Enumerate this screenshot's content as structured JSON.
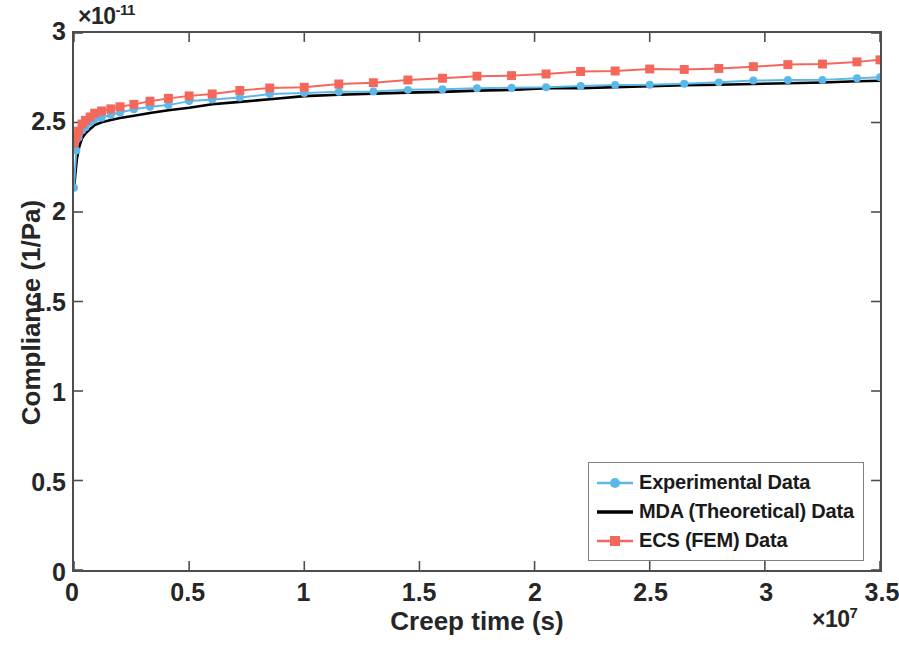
{
  "chart_data": {
    "type": "line",
    "title": "",
    "xlabel": "Creep time (s)",
    "ylabel": "Compliance  (1/Pa)",
    "x_exponent_prefix": "×10",
    "x_exponent_power": "7",
    "y_exponent_prefix": "×10",
    "y_exponent_power": "-11",
    "xlim": [
      0,
      3.5
    ],
    "ylim": [
      0,
      3
    ],
    "xticks": [
      "0",
      "0.5",
      "1",
      "1.5",
      "2",
      "2.5",
      "3",
      "3.5"
    ],
    "xtick_values": [
      0,
      0.5,
      1,
      1.5,
      2,
      2.5,
      3,
      3.5
    ],
    "yticks": [
      "0",
      "0.5",
      "1",
      "1.5",
      "2",
      "2.5",
      "3"
    ],
    "ytick_values": [
      0,
      0.5,
      1,
      1.5,
      2,
      2.5,
      3
    ],
    "grid": false,
    "legend_position": "lower right",
    "series": [
      {
        "name": "Experimental Data",
        "color": "#5BB8E8",
        "marker": "circle",
        "line_width": 2.0,
        "marker_size": 8,
        "x": [
          0.0,
          0.01,
          0.02,
          0.035,
          0.05,
          0.07,
          0.09,
          0.12,
          0.16,
          0.2,
          0.26,
          0.33,
          0.41,
          0.5,
          0.6,
          0.72,
          0.85,
          1.0,
          1.15,
          1.3,
          1.45,
          1.6,
          1.75,
          1.9,
          2.05,
          2.2,
          2.35,
          2.5,
          2.65,
          2.8,
          2.95,
          3.1,
          3.25,
          3.4,
          3.5
        ],
        "y": [
          2.135,
          2.34,
          2.42,
          2.455,
          2.475,
          2.5,
          2.515,
          2.53,
          2.545,
          2.555,
          2.57,
          2.585,
          2.6,
          2.615,
          2.625,
          2.64,
          2.655,
          2.665,
          2.67,
          2.675,
          2.68,
          2.685,
          2.69,
          2.695,
          2.7,
          2.705,
          2.71,
          2.715,
          2.72,
          2.725,
          2.73,
          2.735,
          2.74,
          2.748,
          2.755
        ]
      },
      {
        "name": "MDA (Theoretical) Data",
        "color": "#000000",
        "marker": "none",
        "line_width": 2.6,
        "marker_size": 0,
        "x": [
          0.0,
          0.005,
          0.012,
          0.022,
          0.035,
          0.05,
          0.07,
          0.09,
          0.12,
          0.16,
          0.2,
          0.26,
          0.33,
          0.41,
          0.5,
          0.6,
          0.72,
          0.85,
          1.0,
          1.15,
          1.3,
          1.45,
          1.6,
          1.75,
          1.9,
          2.05,
          2.2,
          2.35,
          2.5,
          2.65,
          2.8,
          2.95,
          3.1,
          3.25,
          3.4,
          3.5
        ],
        "y": [
          2.13,
          2.2,
          2.29,
          2.36,
          2.41,
          2.44,
          2.465,
          2.485,
          2.5,
          2.515,
          2.525,
          2.54,
          2.555,
          2.57,
          2.585,
          2.6,
          2.615,
          2.63,
          2.645,
          2.655,
          2.663,
          2.668,
          2.673,
          2.68,
          2.685,
          2.69,
          2.695,
          2.7,
          2.705,
          2.708,
          2.712,
          2.716,
          2.72,
          2.724,
          2.73,
          2.735
        ]
      },
      {
        "name": "ECS (FEM) Data",
        "color": "#F4685C",
        "marker": "square",
        "line_width": 2.0,
        "marker_size": 9,
        "x": [
          0.0,
          0.01,
          0.02,
          0.035,
          0.05,
          0.07,
          0.09,
          0.12,
          0.16,
          0.2,
          0.26,
          0.33,
          0.41,
          0.5,
          0.6,
          0.72,
          0.85,
          1.0,
          1.15,
          1.3,
          1.45,
          1.6,
          1.75,
          1.9,
          2.05,
          2.2,
          2.35,
          2.5,
          2.65,
          2.8,
          2.95,
          3.1,
          3.25,
          3.4,
          3.5
        ],
        "y": [
          2.385,
          2.42,
          2.455,
          2.49,
          2.515,
          2.535,
          2.55,
          2.565,
          2.58,
          2.59,
          2.605,
          2.62,
          2.635,
          2.65,
          2.66,
          2.675,
          2.69,
          2.7,
          2.715,
          2.72,
          2.735,
          2.745,
          2.755,
          2.765,
          2.775,
          2.785,
          2.79,
          2.795,
          2.8,
          2.805,
          2.812,
          2.82,
          2.828,
          2.838,
          2.848
        ]
      }
    ]
  },
  "legend": {
    "entries": [
      {
        "label": "Experimental Data",
        "color": "#5BB8E8",
        "marker": "circle"
      },
      {
        "label": "MDA (Theoretical) Data",
        "color": "#000000",
        "marker": "none"
      },
      {
        "label": "ECS (FEM) Data",
        "color": "#F4685C",
        "marker": "square"
      }
    ]
  }
}
